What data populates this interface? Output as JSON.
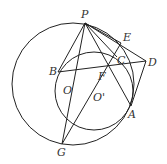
{
  "diagram": {
    "type": "geometry",
    "stroke_color": "#222222",
    "label_color": "#333333",
    "points": {
      "P": "P",
      "E": "E",
      "D": "D",
      "C": "C",
      "B": "B",
      "F": "F",
      "O": "O",
      "O2": "O'",
      "A": "A",
      "G": "G"
    },
    "circles": [
      "circle-O",
      "circle-O-prime"
    ],
    "segments": [
      "PB",
      "PG",
      "PF",
      "PA",
      "PC",
      "PE",
      "PD",
      "BD",
      "ED",
      "DA",
      "EG",
      "BG"
    ]
  }
}
